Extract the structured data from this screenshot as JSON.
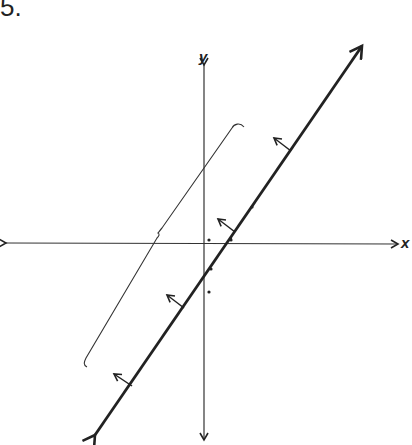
{
  "figure": {
    "number_label": "5.",
    "axes": {
      "x_label": "x",
      "y_label": "y"
    },
    "elements": [
      "x-axis with arrows both directions",
      "y-axis with arrows both directions",
      "thick line with arrowheads at both ends, positive slope",
      "four normal arrows pointing up-left from the thick line",
      "curly brace parallel to the line on the left",
      "data points scattered near origin"
    ],
    "points_near_origin": 6,
    "colors": {
      "ink": "#222222",
      "background": "#ffffff"
    }
  }
}
